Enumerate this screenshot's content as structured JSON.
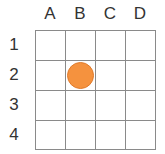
{
  "grid": {
    "columns": [
      "A",
      "B",
      "C",
      "D"
    ],
    "rows": [
      "1",
      "2",
      "3",
      "4"
    ],
    "line_color": "#8a8a8a"
  },
  "pieces": [
    {
      "column": "B",
      "row": "2",
      "shape": "circle",
      "color": "#f5923e"
    }
  ]
}
